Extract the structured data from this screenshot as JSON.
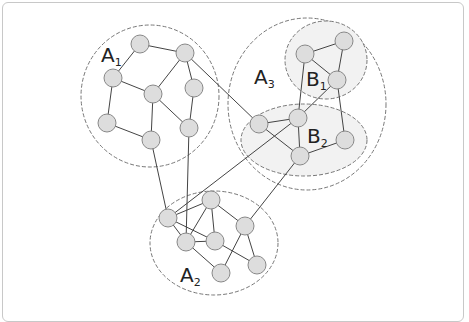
{
  "diagram": {
    "type": "network-clusters",
    "labels": [
      {
        "id": "A1",
        "main": "A",
        "sub": "1",
        "x": 101,
        "y": 62
      },
      {
        "id": "A2",
        "main": "A",
        "sub": "2",
        "x": 180,
        "y": 282
      },
      {
        "id": "A3",
        "main": "A",
        "sub": "3",
        "x": 254,
        "y": 84
      },
      {
        "id": "B1",
        "main": "B",
        "sub": "1",
        "x": 306,
        "y": 86
      },
      {
        "id": "B2",
        "main": "B",
        "sub": "2",
        "x": 307,
        "y": 143
      }
    ],
    "clusters": [
      {
        "id": "A1",
        "cx": 150,
        "cy": 96,
        "rx": 69,
        "ry": 71,
        "fill": "none"
      },
      {
        "id": "A3",
        "cx": 307,
        "cy": 104,
        "rx": 79,
        "ry": 86,
        "fill": "none"
      },
      {
        "id": "B1",
        "cx": 326,
        "cy": 60,
        "rx": 41,
        "ry": 39,
        "fill": "#f2f2f2"
      },
      {
        "id": "B2",
        "cx": 304,
        "cy": 140,
        "rx": 63,
        "ry": 36,
        "fill": "#f2f2f2"
      },
      {
        "id": "A2",
        "cx": 214,
        "cy": 243,
        "rx": 64,
        "ry": 52,
        "fill": "none"
      }
    ],
    "nodes": [
      {
        "id": "a1",
        "x": 140,
        "y": 44
      },
      {
        "id": "a2",
        "x": 185,
        "y": 53
      },
      {
        "id": "a3",
        "x": 113,
        "y": 78
      },
      {
        "id": "a4",
        "x": 153,
        "y": 94
      },
      {
        "id": "a5",
        "x": 194,
        "y": 88
      },
      {
        "id": "a6",
        "x": 107,
        "y": 123
      },
      {
        "id": "a7",
        "x": 151,
        "y": 140
      },
      {
        "id": "a8",
        "x": 189,
        "y": 128
      },
      {
        "id": "b1",
        "x": 305,
        "y": 54
      },
      {
        "id": "b2",
        "x": 344,
        "y": 41
      },
      {
        "id": "b3",
        "x": 337,
        "y": 80
      },
      {
        "id": "c1",
        "x": 259,
        "y": 124
      },
      {
        "id": "c2",
        "x": 298,
        "y": 118
      },
      {
        "id": "c3",
        "x": 300,
        "y": 156
      },
      {
        "id": "c4",
        "x": 345,
        "y": 140
      },
      {
        "id": "d1",
        "x": 168,
        "y": 218
      },
      {
        "id": "d2",
        "x": 211,
        "y": 200
      },
      {
        "id": "d3",
        "x": 186,
        "y": 242
      },
      {
        "id": "d4",
        "x": 215,
        "y": 241
      },
      {
        "id": "d5",
        "x": 245,
        "y": 226
      },
      {
        "id": "d6",
        "x": 221,
        "y": 273
      },
      {
        "id": "d7",
        "x": 257,
        "y": 265
      }
    ],
    "edges": [
      [
        "a1",
        "a2"
      ],
      [
        "a1",
        "a3"
      ],
      [
        "a3",
        "a4"
      ],
      [
        "a3",
        "a6"
      ],
      [
        "a2",
        "a4"
      ],
      [
        "a2",
        "a5"
      ],
      [
        "a4",
        "a7"
      ],
      [
        "a4",
        "a8"
      ],
      [
        "a5",
        "a8"
      ],
      [
        "a6",
        "a7"
      ],
      [
        "a2",
        "c1"
      ],
      [
        "a7",
        "d1"
      ],
      [
        "a8",
        "d3"
      ],
      [
        "b1",
        "b2"
      ],
      [
        "b1",
        "b3"
      ],
      [
        "b2",
        "b3"
      ],
      [
        "b1",
        "c2"
      ],
      [
        "b3",
        "c2"
      ],
      [
        "b3",
        "c4"
      ],
      [
        "c1",
        "c2"
      ],
      [
        "c1",
        "c3"
      ],
      [
        "c2",
        "c3"
      ],
      [
        "c3",
        "c4"
      ],
      [
        "c2",
        "d1"
      ],
      [
        "c3",
        "d5"
      ],
      [
        "d1",
        "d2"
      ],
      [
        "d1",
        "d3"
      ],
      [
        "d1",
        "d4"
      ],
      [
        "d2",
        "d3"
      ],
      [
        "d2",
        "d4"
      ],
      [
        "d2",
        "d5"
      ],
      [
        "d3",
        "d4"
      ],
      [
        "d3",
        "d6"
      ],
      [
        "d4",
        "d7"
      ],
      [
        "d5",
        "d6"
      ],
      [
        "d5",
        "d7"
      ]
    ],
    "colors": {
      "node_fill": "#dddddd",
      "node_stroke": "#888888",
      "edge": "#444444",
      "cluster_stroke": "#777777",
      "cluster_fill": "#f2f2f2"
    }
  }
}
